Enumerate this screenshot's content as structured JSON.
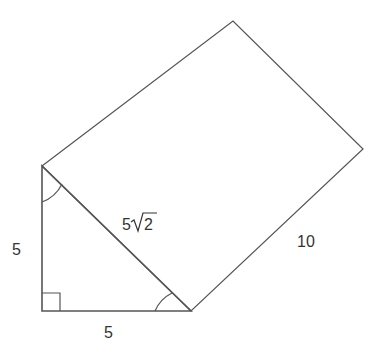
{
  "diagram": {
    "type": "triangular-prism-net",
    "stroke_color": "#555555",
    "label_color": "#333333",
    "points": {
      "triangle_top": [
        42,
        166
      ],
      "triangle_right_angle": [
        42,
        311
      ],
      "triangle_bottom_right": [
        191,
        311
      ],
      "rect_top": [
        233,
        21
      ],
      "rect_right": [
        363,
        149
      ]
    },
    "labels": {
      "vertical_leg": "5",
      "horizontal_leg": "5",
      "hypotenuse_coef": "5",
      "hypotenuse_radicand": "2",
      "rectangle_side": "10"
    },
    "markers": {
      "right_angle": "right-angle-square",
      "angle_top": "arc",
      "angle_bottom_right": "arc"
    }
  }
}
